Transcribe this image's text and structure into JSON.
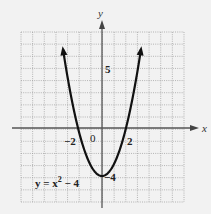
{
  "chart_data": {
    "type": "line",
    "title": "",
    "xlabel": "x",
    "ylabel": "y",
    "xlim": [
      -7,
      7
    ],
    "ylim": [
      -6,
      8
    ],
    "grid": true,
    "tick_labels": {
      "x": [
        "-2",
        "0",
        "2"
      ],
      "y": [
        "5",
        "-4"
      ]
    },
    "series": [
      {
        "name": "y = x^2 - 4",
        "function": "x^2 - 4",
        "x": [
          -3.3,
          -3,
          -2.5,
          -2,
          -1.5,
          -1,
          -0.5,
          0,
          0.5,
          1,
          1.5,
          2,
          2.5,
          3,
          3.3
        ],
        "y": [
          6.89,
          5,
          2.25,
          0,
          -1.75,
          -3,
          -3.75,
          -4,
          -3.75,
          -3,
          -1.75,
          0,
          2.25,
          5,
          6.89
        ]
      }
    ],
    "annotations": [
      "y = x² − 4"
    ]
  },
  "labels": {
    "x_axis": "x",
    "y_axis": "y",
    "origin": "0",
    "x_neg2": "−2",
    "x_pos2": "2",
    "y_5": "5",
    "y_neg4": "−4",
    "equation_lhs": "y = x",
    "equation_exp": "2",
    "equation_rhs": " − 4"
  }
}
